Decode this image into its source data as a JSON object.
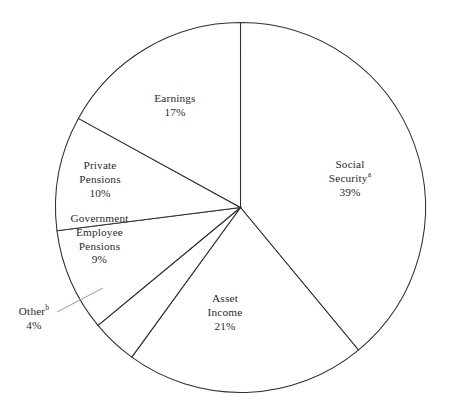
{
  "chart_data": {
    "type": "pie",
    "title": "",
    "subtitle": "",
    "xlabel": "",
    "ylabel": "",
    "legend_position": "none",
    "labels_inline": true,
    "start_angle_deg": 0,
    "direction": "clockwise",
    "categories": [
      "Social Security",
      "Asset Income",
      "Other",
      "Government Employee Pensions",
      "Private Pensions",
      "Earnings"
    ],
    "values": [
      39,
      21,
      4,
      9,
      10,
      17
    ],
    "units": "percent",
    "slices": [
      {
        "key": "social-security",
        "name": "Social",
        "name_line2": "Security",
        "name_full": "Social Security",
        "footnote": "a",
        "value": 39,
        "value_label": "39%",
        "start_deg": 0,
        "end_deg": 140.4
      },
      {
        "key": "asset-income",
        "name": "Asset",
        "name_line2": "Income",
        "name_full": "Asset Income",
        "footnote": "",
        "value": 21,
        "value_label": "21%",
        "start_deg": 140.4,
        "end_deg": 216.0
      },
      {
        "key": "other",
        "name": "Other",
        "name_line2": "",
        "name_full": "Other",
        "footnote": "b",
        "value": 4,
        "value_label": "4%",
        "start_deg": 216.0,
        "end_deg": 230.4
      },
      {
        "key": "government-employee-pensions",
        "name": "Government",
        "name_line2": "Employee",
        "name_line3": "Pensions",
        "name_full": "Government Employee Pensions",
        "footnote": "",
        "value": 9,
        "value_label": "9%",
        "start_deg": 230.4,
        "end_deg": 262.8
      },
      {
        "key": "private-pensions",
        "name": "Private",
        "name_line2": "Pensions",
        "name_full": "Private Pensions",
        "footnote": "",
        "value": 10,
        "value_label": "10%",
        "start_deg": 262.8,
        "end_deg": 298.8
      },
      {
        "key": "earnings",
        "name": "Earnings",
        "name_line2": "",
        "name_full": "Earnings",
        "footnote": "",
        "value": 17,
        "value_label": "17%",
        "start_deg": 298.8,
        "end_deg": 360.0
      }
    ],
    "colors": {
      "slice_fill": "#ffffff",
      "slice_stroke": "#2f2f2f",
      "leader_line": "#9a9a9a",
      "text": "#2b2b2b",
      "background": "#ffffff"
    }
  }
}
